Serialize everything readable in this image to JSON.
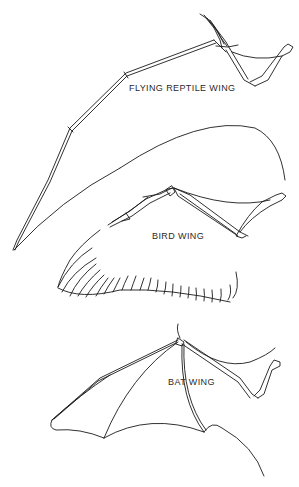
{
  "figure": {
    "top_cut_text": "",
    "stroke_color": "#1a1a1a",
    "background": "#ffffff",
    "panels": [
      {
        "id": "reptile",
        "label": "FLYING REPTILE WING"
      },
      {
        "id": "bird",
        "label": "BIRD WING"
      },
      {
        "id": "bat",
        "label": "BAT WING"
      }
    ]
  }
}
